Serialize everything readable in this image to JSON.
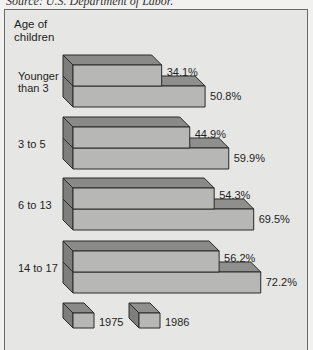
{
  "source_text": "Source: U.S. Department of Labor.",
  "axis_title_line1": "Age of",
  "axis_title_line2": "children",
  "colors": {
    "front": "#b7b7b5",
    "top_1975": "#8a8a88",
    "top_1986": "#8f8f8d",
    "side": "#7e7e7c",
    "edge": "#2a2a2a",
    "background": "#e6e6e4"
  },
  "categories": [
    {
      "label_lines": [
        "Younger",
        "than 3"
      ],
      "v1975": 34.1,
      "v1986": 50.8,
      "l1975": "34.1%",
      "l1986": "50.8%"
    },
    {
      "label_lines": [
        "3 to 5"
      ],
      "v1975": 44.9,
      "v1986": 59.9,
      "l1975": "44.9%",
      "l1986": "59.9%"
    },
    {
      "label_lines": [
        "6 to 13"
      ],
      "v1975": 54.3,
      "v1986": 69.5,
      "l1975": "54.3%",
      "l1986": "69.5%"
    },
    {
      "label_lines": [
        "14 to 17"
      ],
      "v1975": 56.2,
      "v1986": 72.2,
      "l1975": "56.2%",
      "l1986": "72.2%"
    }
  ],
  "legend": [
    {
      "label": "1975"
    },
    {
      "label": "1986"
    }
  ],
  "chart_data": {
    "type": "bar",
    "orientation": "horizontal",
    "style": "3d",
    "title": "",
    "source": "Source: U.S. Department of Labor.",
    "ylabel": "Age of children",
    "xlabel": "",
    "categories": [
      "Younger than 3",
      "3 to 5",
      "6 to 13",
      "14 to 17"
    ],
    "series": [
      {
        "name": "1975",
        "values": [
          34.1,
          44.9,
          54.3,
          56.2
        ]
      },
      {
        "name": "1986",
        "values": [
          50.8,
          59.9,
          69.5,
          72.2
        ]
      }
    ],
    "units": "%",
    "data_labels": true,
    "grid": false,
    "legend_position": "bottom-left"
  }
}
